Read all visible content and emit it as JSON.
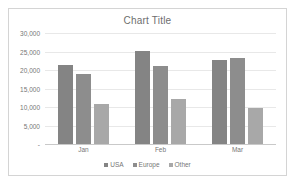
{
  "chart_data": {
    "type": "bar",
    "title": "Chart Title",
    "xlabel": "",
    "ylabel": "",
    "categories": [
      "Jan",
      "Feb",
      "Mar"
    ],
    "series": [
      {
        "name": "USA",
        "color": "#848484",
        "values": [
          21300,
          25200,
          22600
        ]
      },
      {
        "name": "Europe",
        "color": "#8d8d8d",
        "values": [
          19000,
          21100,
          23300
        ]
      },
      {
        "name": "Other",
        "color": "#a8a8a8",
        "values": [
          10800,
          12100,
          9700
        ]
      }
    ],
    "ylim": [
      0,
      30000
    ],
    "ytick_values": [
      30000,
      25000,
      20000,
      15000,
      10000,
      5000,
      0
    ],
    "ytick_labels": [
      "30,000",
      "25,000",
      "20,000",
      "15,000",
      "10,000",
      "5,000",
      "-"
    ],
    "grid": true,
    "legend_position": "bottom"
  }
}
